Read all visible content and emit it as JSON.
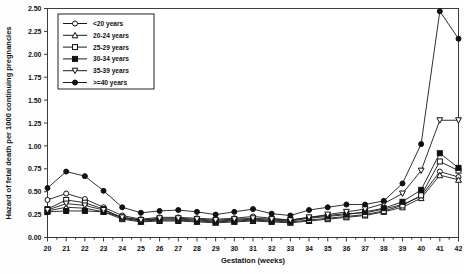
{
  "chart_data": {
    "type": "line",
    "title": "",
    "xlabel": "Gestation (weeks)",
    "ylabel": "Hazard of fetal death per 1000 continuing pregnancies",
    "xlim": [
      20,
      42
    ],
    "ylim": [
      0.0,
      2.5
    ],
    "grid": false,
    "legend_position": "top-left",
    "x": [
      20,
      21,
      22,
      23,
      24,
      25,
      26,
      27,
      28,
      29,
      30,
      31,
      32,
      33,
      34,
      35,
      36,
      37,
      38,
      39,
      40,
      41,
      42
    ],
    "xticklabels": [
      "20",
      "21",
      "22",
      "23",
      "24",
      "25",
      "26",
      "27",
      "28",
      "29",
      "30",
      "31",
      "32",
      "33",
      "34",
      "35",
      "36",
      "37",
      "38",
      "39",
      "40",
      "41",
      "42"
    ],
    "yticklabels": [
      "0.00",
      "0.25",
      "0.50",
      "0.75",
      "1.00",
      "1.25",
      "1.50",
      "1.75",
      "2.00",
      "2.25",
      "2.50"
    ],
    "yticks": [
      0.0,
      0.25,
      0.5,
      0.75,
      1.0,
      1.25,
      1.5,
      1.75,
      2.0,
      2.25,
      2.5
    ],
    "series": [
      {
        "name": "<20 years",
        "marker": "circle-open",
        "color": "#1a1a1a",
        "values": [
          0.41,
          0.48,
          0.42,
          0.33,
          0.24,
          0.2,
          0.22,
          0.22,
          0.21,
          0.2,
          0.21,
          0.23,
          0.21,
          0.19,
          0.22,
          0.24,
          0.26,
          0.27,
          0.31,
          0.36,
          0.45,
          0.72,
          0.66
        ]
      },
      {
        "name": "20-24 years",
        "marker": "triangle-open",
        "color": "#1a1a1a",
        "values": [
          0.29,
          0.33,
          0.32,
          0.28,
          0.2,
          0.17,
          0.18,
          0.18,
          0.17,
          0.16,
          0.17,
          0.18,
          0.17,
          0.16,
          0.18,
          0.2,
          0.22,
          0.24,
          0.28,
          0.33,
          0.43,
          0.68,
          0.63
        ]
      },
      {
        "name": "25-29 years",
        "marker": "square-open",
        "color": "#1a1a1a",
        "values": [
          0.31,
          0.41,
          0.38,
          0.31,
          0.21,
          0.18,
          0.19,
          0.19,
          0.18,
          0.17,
          0.18,
          0.19,
          0.18,
          0.17,
          0.19,
          0.21,
          0.23,
          0.25,
          0.29,
          0.35,
          0.46,
          0.83,
          0.73
        ]
      },
      {
        "name": "30-34 years",
        "marker": "square-filled",
        "color": "#1a1a1a",
        "values": [
          0.28,
          0.29,
          0.29,
          0.28,
          0.22,
          0.19,
          0.2,
          0.2,
          0.19,
          0.18,
          0.19,
          0.2,
          0.19,
          0.18,
          0.21,
          0.23,
          0.25,
          0.28,
          0.32,
          0.39,
          0.52,
          0.92,
          0.76
        ]
      },
      {
        "name": "35-39 years",
        "marker": "triangle-down-open",
        "color": "#1a1a1a",
        "values": [
          0.3,
          0.37,
          0.35,
          0.3,
          0.22,
          0.19,
          0.21,
          0.21,
          0.2,
          0.19,
          0.2,
          0.21,
          0.2,
          0.19,
          0.22,
          0.25,
          0.28,
          0.31,
          0.37,
          0.48,
          0.73,
          1.28,
          1.28
        ]
      },
      {
        "name": ">=40 years",
        "marker": "circle-filled",
        "color": "#1a1a1a",
        "values": [
          0.54,
          0.72,
          0.67,
          0.51,
          0.33,
          0.27,
          0.29,
          0.3,
          0.28,
          0.25,
          0.28,
          0.31,
          0.26,
          0.24,
          0.3,
          0.33,
          0.36,
          0.36,
          0.4,
          0.59,
          1.02,
          2.47,
          2.17
        ]
      }
    ]
  }
}
